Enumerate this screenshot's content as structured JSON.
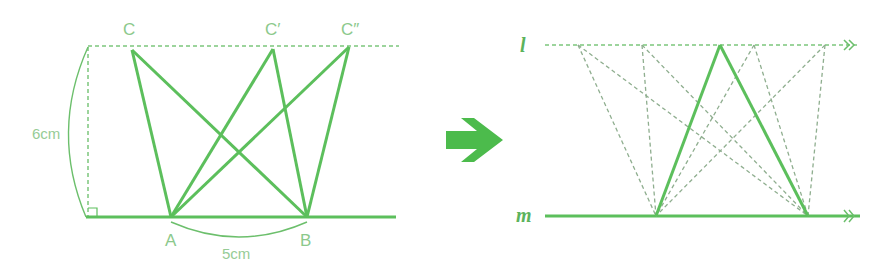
{
  "colors": {
    "solid": "#5cbf5c",
    "dashed_left": "#7cc67c",
    "dashed_right": "#8fae8f",
    "label": "#8cc98c",
    "arrow": "#4cbb4c"
  },
  "left_figure": {
    "vertices": {
      "A": {
        "label": "A",
        "x": 171,
        "y": 217
      },
      "B": {
        "label": "B",
        "x": 307,
        "y": 217
      },
      "C": {
        "label": "C",
        "x": 132,
        "y": 49
      },
      "C1": {
        "label": "C′",
        "x": 273,
        "y": 49
      },
      "C2": {
        "label": "C″",
        "x": 349,
        "y": 47
      }
    },
    "height_label": "6cm",
    "base_label": "5cm"
  },
  "transition_arrow": {
    "icon": "right-arrow-icon"
  },
  "right_figure": {
    "line_l_label": "l",
    "line_m_label": "m",
    "apex": {
      "x": 720,
      "y": 45
    },
    "base_left": {
      "x": 656,
      "y": 216
    },
    "base_right": {
      "x": 808,
      "y": 216
    },
    "dashed_top_points": [
      578,
      642,
      754,
      825
    ]
  }
}
